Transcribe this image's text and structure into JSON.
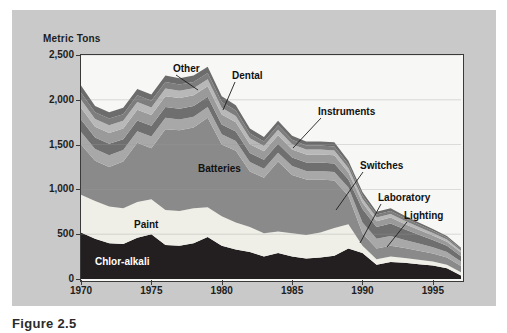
{
  "figure": {
    "caption": "Figure 2.5"
  },
  "chart_data": {
    "type": "area",
    "stacked": true,
    "title": "",
    "subtitle": "",
    "xlabel": "",
    "ylabel": "Metric Tons",
    "ylim": [
      0,
      2500
    ],
    "xlim": [
      1970,
      1997
    ],
    "grid": "horizontal",
    "legend_position": "in-plot annotations",
    "y_ticks": [
      "0",
      "500",
      "1,000",
      "1,500",
      "2,000",
      "2,500"
    ],
    "y_tick_values": [
      0,
      500,
      1000,
      1500,
      2000,
      2500
    ],
    "x_ticks": [
      "1970",
      "1975",
      "1980",
      "1985",
      "1990",
      "1995"
    ],
    "x_tick_values": [
      1970,
      1975,
      1980,
      1985,
      1990,
      1995
    ],
    "x": [
      1970,
      1971,
      1972,
      1973,
      1974,
      1975,
      1976,
      1977,
      1978,
      1979,
      1980,
      1981,
      1982,
      1983,
      1984,
      1985,
      1986,
      1987,
      1988,
      1989,
      1990,
      1991,
      1992,
      1993,
      1994,
      1995,
      1996,
      1997
    ],
    "series": [
      {
        "name": "Chlor-alkali",
        "color": "#231f20",
        "label_color": "#ffffff",
        "values": [
          520,
          450,
          400,
          390,
          460,
          500,
          380,
          370,
          400,
          470,
          370,
          330,
          300,
          250,
          290,
          250,
          230,
          240,
          260,
          340,
          290,
          160,
          190,
          180,
          165,
          150,
          120,
          40
        ]
      },
      {
        "name": "Paint",
        "color": "#efefe8",
        "label_color": "#111111",
        "values": [
          420,
          420,
          410,
          400,
          400,
          390,
          390,
          390,
          390,
          330,
          330,
          300,
          280,
          260,
          240,
          260,
          260,
          280,
          310,
          270,
          80,
          60,
          60,
          55,
          50,
          45,
          40,
          35
        ]
      },
      {
        "name": "Batteries",
        "color": "#8a8a8a",
        "label_color": "#111111",
        "values": [
          560,
          450,
          440,
          520,
          660,
          570,
          900,
          900,
          900,
          1000,
          800,
          800,
          620,
          620,
          780,
          650,
          620,
          590,
          530,
          320,
          140,
          120,
          120,
          110,
          100,
          90,
          80,
          70
        ]
      },
      {
        "name": "Instruments",
        "color": "#a8a8a8",
        "label_color": "#111111",
        "values": [
          140,
          130,
          130,
          130,
          130,
          130,
          130,
          120,
          120,
          120,
          115,
          110,
          105,
          100,
          100,
          100,
          95,
          95,
          95,
          90,
          120,
          110,
          110,
          90,
          80,
          70,
          60,
          50
        ]
      },
      {
        "name": "Switches",
        "color": "#6f6f6f",
        "label_color": "#111111",
        "values": [
          140,
          130,
          130,
          120,
          120,
          120,
          120,
          120,
          120,
          115,
          110,
          105,
          100,
          100,
          100,
          95,
          95,
          95,
          95,
          90,
          150,
          130,
          140,
          120,
          100,
          80,
          70,
          60
        ]
      },
      {
        "name": "Dental",
        "color": "#9a9a9a",
        "label_color": "#111111",
        "values": [
          130,
          120,
          120,
          120,
          120,
          120,
          120,
          120,
          120,
          115,
          110,
          105,
          100,
          95,
          95,
          90,
          90,
          90,
          90,
          80,
          70,
          65,
          65,
          60,
          55,
          50,
          45,
          40
        ]
      },
      {
        "name": "Laboratory",
        "color": "#b8b8b8",
        "label_color": "#111111",
        "values": [
          90,
          85,
          85,
          85,
          85,
          85,
          85,
          80,
          80,
          80,
          75,
          70,
          65,
          60,
          60,
          60,
          55,
          55,
          55,
          50,
          45,
          40,
          40,
          35,
          30,
          28,
          25,
          20
        ]
      },
      {
        "name": "Lighting",
        "color": "#7d7d7d",
        "label_color": "#111111",
        "values": [
          80,
          75,
          75,
          75,
          75,
          75,
          75,
          70,
          70,
          70,
          65,
          60,
          55,
          50,
          50,
          50,
          45,
          45,
          45,
          40,
          40,
          35,
          35,
          30,
          28,
          25,
          22,
          20
        ]
      },
      {
        "name": "Other",
        "color": "#6c6c6c",
        "label_color": "#111111",
        "values": [
          80,
          70,
          70,
          70,
          70,
          70,
          70,
          70,
          70,
          70,
          65,
          60,
          55,
          50,
          50,
          45,
          45,
          45,
          45,
          40,
          35,
          30,
          30,
          25,
          22,
          20,
          18,
          15
        ]
      }
    ],
    "annotations": [
      {
        "text": "Other",
        "x": 173,
        "y": 63,
        "anchor_x": 198,
        "anchor_y": 90,
        "style": "dark"
      },
      {
        "text": "Dental",
        "x": 232,
        "y": 70,
        "anchor_x": 223,
        "anchor_y": 110,
        "style": "dark"
      },
      {
        "text": "Instruments",
        "x": 318,
        "y": 106,
        "anchor_x": 293,
        "anchor_y": 148,
        "style": "dark"
      },
      {
        "text": "Batteries",
        "x": 198,
        "y": 163,
        "anchor_x": null,
        "anchor_y": null,
        "style": "dark"
      },
      {
        "text": "Switches",
        "x": 360,
        "y": 160,
        "anchor_x": 336,
        "anchor_y": 210,
        "style": "dark"
      },
      {
        "text": "Laboratory",
        "x": 378,
        "y": 192,
        "anchor_x": 360,
        "anchor_y": 243,
        "style": "dark"
      },
      {
        "text": "Lighting",
        "x": 404,
        "y": 210,
        "anchor_x": 387,
        "anchor_y": 247,
        "style": "dark"
      },
      {
        "text": "Paint",
        "x": 134,
        "y": 219,
        "anchor_x": null,
        "anchor_y": null,
        "style": "dark"
      },
      {
        "text": "Chlor-alkali",
        "x": 95,
        "y": 256,
        "anchor_x": null,
        "anchor_y": null,
        "style": "light"
      }
    ]
  }
}
